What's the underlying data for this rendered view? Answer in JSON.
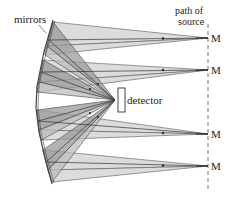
{
  "diagram": {
    "labels": {
      "mirrors": "mirrors",
      "detector": "detector",
      "path_line1": "path of",
      "path_line2": "source"
    },
    "sources": [
      {
        "label": "M",
        "y": 38
      },
      {
        "label": "M",
        "y": 70
      },
      {
        "label": "M",
        "y": 134
      },
      {
        "label": "M",
        "y": 166
      }
    ],
    "colors": {
      "light_beam": "#d9d9d9",
      "dark_beam": "#8f8f8f",
      "line": "#333333",
      "mirror": "#444444"
    }
  }
}
